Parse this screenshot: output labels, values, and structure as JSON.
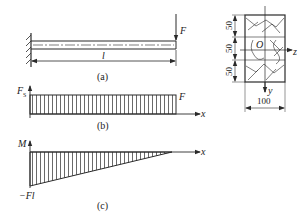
{
  "figure_a": {
    "caption": "(a)",
    "force_label": "F",
    "length_label": "l"
  },
  "cross_section": {
    "dimensions_vertical": [
      "50",
      "50",
      "50"
    ],
    "dimension_horizontal": "100",
    "origin_label": "O",
    "z_axis_label": "z",
    "y_axis_label": "y"
  },
  "figure_b": {
    "caption": "(b)",
    "y_axis_label": "F",
    "y_axis_subscript": "S",
    "x_axis_label": "x",
    "value_label": "F"
  },
  "figure_c": {
    "caption": "(c)",
    "y_axis_label": "M",
    "x_axis_label": "x",
    "value_label": "−Fl"
  },
  "colors": {
    "line": "#2a2a2a",
    "background": "#ffffff"
  }
}
